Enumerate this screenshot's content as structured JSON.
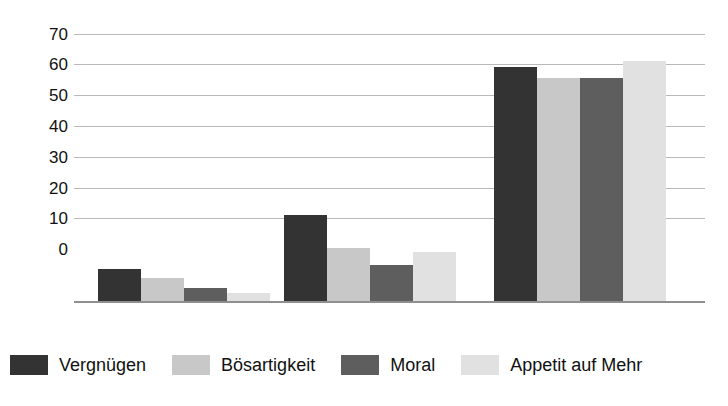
{
  "chart_data": {
    "type": "bar",
    "title": "",
    "xlabel": "",
    "ylabel": "",
    "ylim": [
      0,
      70
    ],
    "yticks": [
      0,
      10,
      20,
      30,
      40,
      50,
      60,
      70
    ],
    "grid": true,
    "legend_position": "bottom",
    "categories": [
      "Gruppe 1",
      "Gruppe 2",
      "Gruppe 3"
    ],
    "series": [
      {
        "name": "Vergnügen",
        "color": "#333333",
        "values": [
          8.8,
          22.8,
          61.5
        ]
      },
      {
        "name": "Bösartigkeit",
        "color": "#c8c8c8",
        "values": [
          6.6,
          14.2,
          58.5
        ]
      },
      {
        "name": "Moral",
        "color": "#5e5e5e",
        "values": [
          4.0,
          9.8,
          58.5
        ]
      },
      {
        "name": "Appetit auf Mehr",
        "color": "#e1e1e1",
        "values": [
          2.5,
          13.3,
          63.0
        ]
      }
    ]
  },
  "legend": {
    "items": [
      {
        "label": "Vergnügen"
      },
      {
        "label": "Bösartigkeit"
      },
      {
        "label": "Moral"
      },
      {
        "label": "Appetit auf Mehr"
      }
    ]
  },
  "axis": {
    "ytick_labels": [
      "70",
      "60",
      "50",
      "40",
      "30",
      "20",
      "10",
      "0"
    ]
  }
}
